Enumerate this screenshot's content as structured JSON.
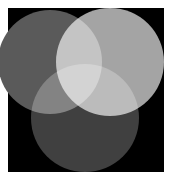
{
  "diagram": {
    "type": "venn-three-circles",
    "background": {
      "x": 8,
      "y": 8,
      "width": 156,
      "height": 164,
      "color": "#000000"
    },
    "circles": [
      {
        "name": "left",
        "cx": 50,
        "cy": 62,
        "r": 52,
        "color": "#5a5a5a"
      },
      {
        "name": "right",
        "cx": 110,
        "cy": 62,
        "r": 54,
        "color": "#a4a4a4"
      },
      {
        "name": "bottom",
        "cx": 85,
        "cy": 118,
        "r": 54,
        "color": "#404040"
      }
    ],
    "overlap_colors": {
      "left_right": "#d8d8d8",
      "left_bottom": "#7a7a7a",
      "right_bottom": "#b4b4b4",
      "all_three": "#ffffff"
    }
  }
}
